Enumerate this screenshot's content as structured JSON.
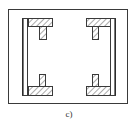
{
  "figure": {
    "caption": "c)",
    "colors": {
      "stroke": "#3a3a3a",
      "hatch": "#555555",
      "background": "#ffffff"
    },
    "outer_frame": {
      "x": 8,
      "y": 9,
      "w": 120,
      "h": 95
    },
    "pieces": [
      {
        "name": "top-left-t-section",
        "flange": {
          "x": 28,
          "y": 18,
          "w": 25,
          "h": 9
        },
        "stem": {
          "x": 39,
          "y": 27,
          "w": 8,
          "h": 13
        }
      },
      {
        "name": "top-right-t-section",
        "flange": {
          "x": 86,
          "y": 18,
          "w": 24,
          "h": 9
        },
        "stem": {
          "x": 92,
          "y": 27,
          "w": 7,
          "h": 13
        }
      },
      {
        "name": "bottom-left-t-section",
        "flange": {
          "x": 28,
          "y": 86,
          "w": 25,
          "h": 10
        },
        "stem": {
          "x": 39,
          "y": 74,
          "w": 7,
          "h": 12
        }
      },
      {
        "name": "bottom-right-t-section",
        "flange": {
          "x": 86,
          "y": 86,
          "w": 24,
          "h": 10
        },
        "stem": {
          "x": 92,
          "y": 74,
          "w": 7,
          "h": 12
        }
      }
    ],
    "side_plates": [
      {
        "name": "left-side-plate",
        "x": 22,
        "y": 18,
        "w": 6,
        "h": 78
      },
      {
        "name": "right-side-plate",
        "x": 110,
        "y": 18,
        "w": 6,
        "h": 78
      }
    ]
  }
}
